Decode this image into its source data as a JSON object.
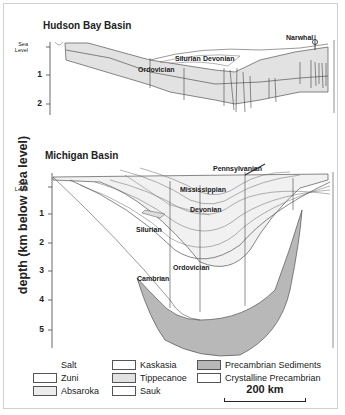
{
  "figure": {
    "y_axis_label": "depth (km below sea level)",
    "scale_bar": "200 km"
  },
  "hudson_bay": {
    "title": "Hudson Bay Basin",
    "sea_level_label": [
      "Sea",
      "Level"
    ],
    "ticks": [
      "1",
      "2"
    ],
    "units": {
      "ordovician": "Ordovician",
      "silurian": "Silurian",
      "devonian": "Devonian"
    },
    "well_label": "Narwhal"
  },
  "michigan": {
    "title": "Michigan Basin",
    "sea_level_label": [
      "Sea",
      "Level"
    ],
    "ticks": [
      "1",
      "2",
      "3",
      "4",
      "5"
    ],
    "units": {
      "pennsylvanian": "Pennsylvanian",
      "mississippian": "Mississippian",
      "devonian": "Devonian",
      "silurian": "Silurian",
      "ordovician": "Ordovician",
      "cambrian": "Cambrian"
    }
  },
  "legend": [
    {
      "label": "Salt",
      "color": null
    },
    {
      "label": "Zuni",
      "color": "#ffffff"
    },
    {
      "label": "Absaroka",
      "color": "#ececec"
    },
    {
      "label": "Kaskasia",
      "color": "#ffffff"
    },
    {
      "label": "Tippecanoe",
      "color": "#e2e2e2"
    },
    {
      "label": "Sauk",
      "color": "#ffffff"
    },
    {
      "label": "Precambrian Sediments",
      "color": "#b8b8b8"
    },
    {
      "label": "Crystalline Precambrian",
      "color": "#ffffff"
    }
  ],
  "colors": {
    "tippecanoe_fill": "#e2e2e2",
    "precambrian_sed_fill": "#b8b8b8",
    "line": "#555555"
  }
}
